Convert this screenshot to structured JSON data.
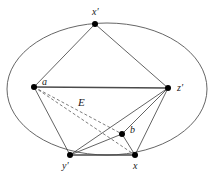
{
  "figure": {
    "region_label": "E",
    "region_label_name": "ellipse-region-label",
    "colors": {
      "background": "#ffffff",
      "edge": "#3c3c3c",
      "edge_thick": "#4a4a4a",
      "dashed_edge": "#5a5a5a",
      "curve": "#555555",
      "vertex": "#000000",
      "label": "#1a1a1a"
    },
    "ellipse": {
      "center_x": 107,
      "center_y": 89,
      "radius_x": 100,
      "radius_y": 66
    },
    "vertices": [
      {
        "id": "x-prime",
        "label": "x′",
        "x": 95,
        "y": 24,
        "label_x": 92,
        "label_y": 15
      },
      {
        "id": "a",
        "label": "a",
        "x": 34,
        "y": 87,
        "label_x": 42,
        "label_y": 85
      },
      {
        "id": "z-prime",
        "label": "z′",
        "x": 168,
        "y": 88,
        "label_x": 177,
        "label_y": 91
      },
      {
        "id": "b",
        "label": "b",
        "x": 122,
        "y": 134,
        "label_x": 130,
        "label_y": 133
      },
      {
        "id": "y-prime",
        "label": "y′",
        "x": 70,
        "y": 155,
        "label_x": 62,
        "label_y": 169
      },
      {
        "id": "x",
        "label": "x",
        "x": 135,
        "y": 155,
        "label_x": 133,
        "label_y": 169
      }
    ],
    "edges": [
      {
        "id": "edge-a-xprime",
        "from": "a",
        "to": "x-prime",
        "style": "solid"
      },
      {
        "id": "edge-xprime-zprime",
        "from": "x-prime",
        "to": "z-prime",
        "style": "solid"
      },
      {
        "id": "edge-a-zprime",
        "from": "a",
        "to": "z-prime",
        "style": "thick"
      },
      {
        "id": "edge-a-yprime",
        "from": "a",
        "to": "y-prime",
        "style": "solid"
      },
      {
        "id": "edge-a-b",
        "from": "a",
        "to": "b",
        "style": "dashed"
      },
      {
        "id": "edge-a-x",
        "from": "a",
        "to": "x",
        "style": "dashed"
      },
      {
        "id": "edge-yprime-zprime",
        "from": "y-prime",
        "to": "z-prime",
        "style": "solid"
      },
      {
        "id": "edge-b-zprime",
        "from": "b",
        "to": "z-prime",
        "style": "solid"
      },
      {
        "id": "edge-x-zprime",
        "from": "x",
        "to": "z-prime",
        "style": "solid"
      },
      {
        "id": "edge-yprime-b",
        "from": "y-prime",
        "to": "b",
        "style": "solid"
      },
      {
        "id": "edge-b-x",
        "from": "b",
        "to": "x",
        "style": "solid"
      },
      {
        "id": "edge-yprime-x",
        "from": "y-prime",
        "to": "x",
        "style": "thick"
      }
    ],
    "region_label_pos": {
      "x": 78,
      "y": 106
    }
  }
}
